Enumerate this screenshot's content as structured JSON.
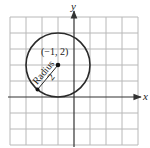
{
  "diagram": {
    "type": "coordinate-plane-circle",
    "axes": {
      "x_label": "x",
      "y_label": "y"
    },
    "grid": {
      "x_range": [
        -4,
        4
      ],
      "y_range": [
        -3,
        5
      ],
      "step": 1
    },
    "circle": {
      "center": [
        -1,
        2
      ],
      "center_label": "(−1, 2)",
      "radius": 2,
      "radius_text": "Radius",
      "radius_value": "2"
    },
    "colors": {
      "grid": "#b8b8b8",
      "axis": "#333333",
      "circle": "#2a2a2a",
      "background": "#ffffff"
    }
  }
}
